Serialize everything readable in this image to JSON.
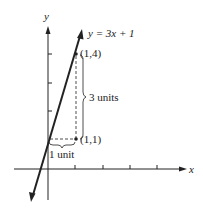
{
  "diagram": {
    "axis_x_label": "x",
    "axis_y_label": "y",
    "equation_label": "y = 3x + 1",
    "point_upper_label": "(1,4)",
    "point_lower_label": "(1,1)",
    "rise_label": "3 units",
    "run_label": "1 unit",
    "colors": {
      "ink": "#222222",
      "background": "#ffffff"
    }
  }
}
